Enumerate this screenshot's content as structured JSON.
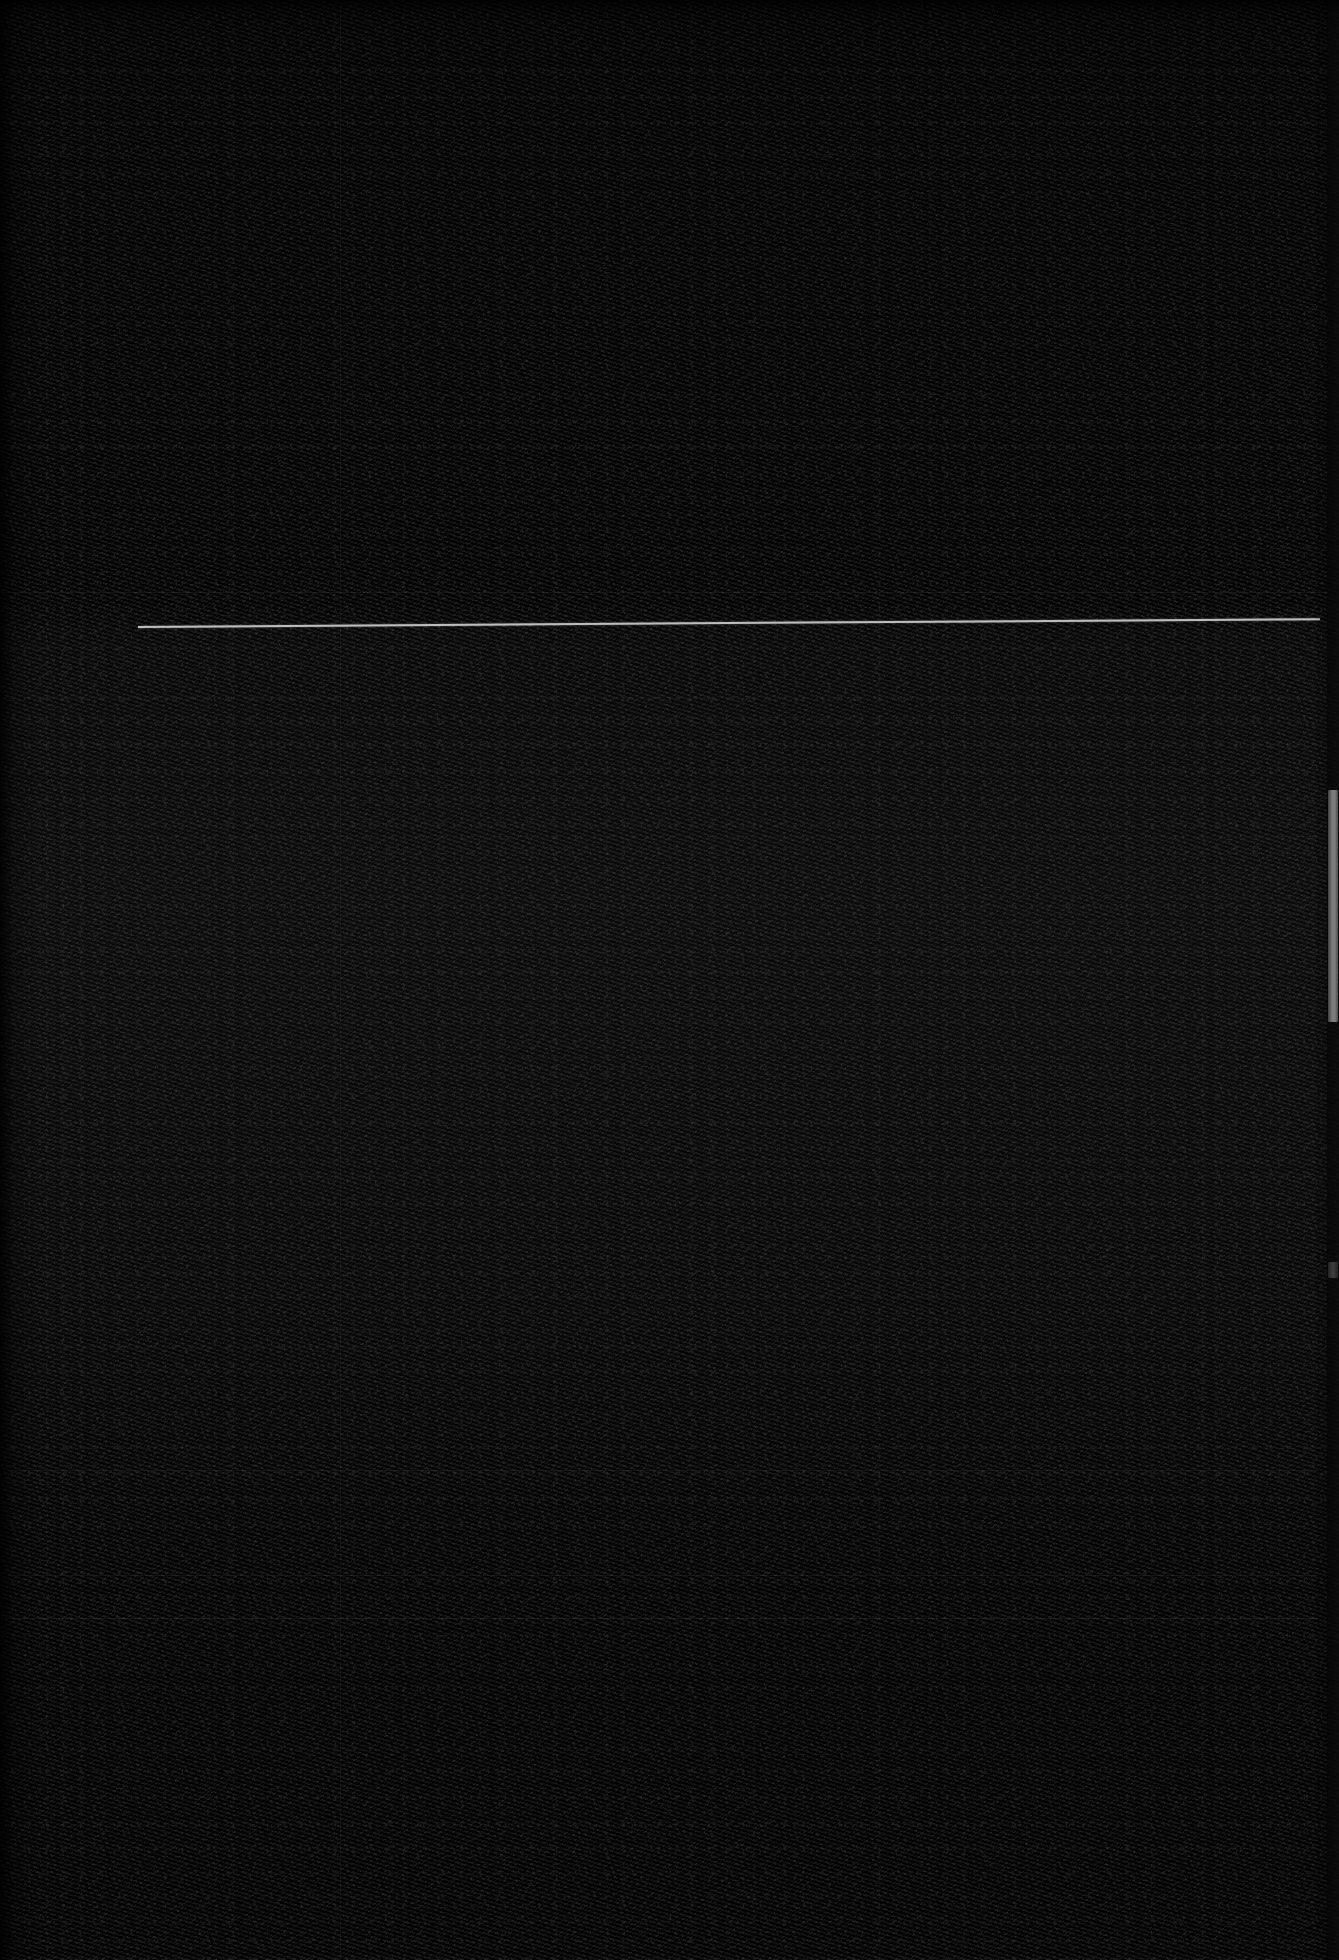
{
  "capture": {
    "title": "",
    "description": "Near-black high-noise screen capture; no legible text content is rendered in the pixels.",
    "width": 1339,
    "height": 1960
  },
  "appearance": {
    "theme": "dark",
    "background_color": "#151515",
    "noise_dark": "#000000",
    "noise_light": "#3a3a3a",
    "border_color": "#000000"
  },
  "content_rule": {
    "name": "horizontal-rule",
    "color": "#bdbdbd",
    "start_x": 138,
    "start_y": 630,
    "end_x": 1320,
    "end_y": 622,
    "thickness_px": 2
  },
  "scrollbar": {
    "orientation": "vertical",
    "track_color": "#1c1c1c",
    "thumb_color": "#e0e0e0",
    "track_x": 1327,
    "track_width": 12,
    "thumb_top": 790,
    "thumb_height": 232,
    "secondary_mark_top": 1262,
    "secondary_mark_height": 16
  },
  "faint_dividers": [
    {
      "name": "divider-upper",
      "x": 8,
      "y": 1470,
      "width": 1310
    },
    {
      "name": "divider-mid",
      "x": 8,
      "y": 1575,
      "width": 1310
    },
    {
      "name": "divider-lower",
      "x": 8,
      "y": 1618,
      "width": 1310
    },
    {
      "name": "divider-band-top",
      "x": 0,
      "y": 592,
      "width": 1327
    }
  ],
  "faint_seams": [
    {
      "name": "seam-column",
      "x": 340,
      "y": 0,
      "height": 1960
    }
  ],
  "edges": {
    "left_border_width": 10,
    "top_border_height": 8,
    "right_border_width": 4
  }
}
